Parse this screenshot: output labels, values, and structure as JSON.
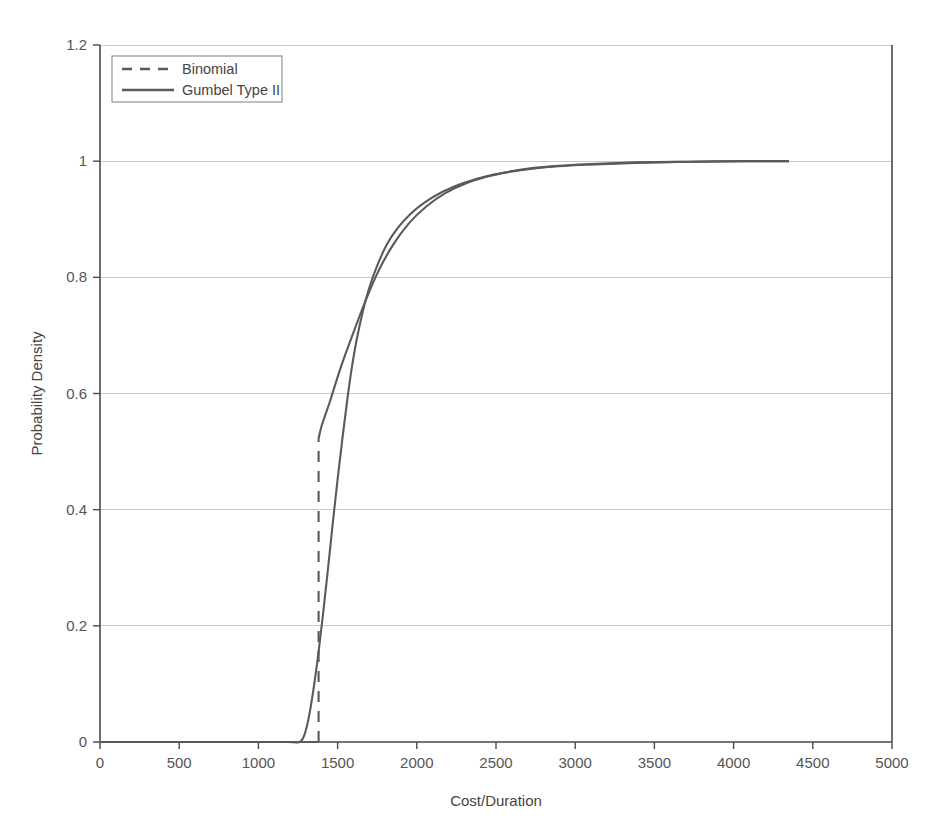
{
  "chart_data": {
    "type": "line",
    "title": "",
    "xlabel": "Cost/Duration",
    "ylabel": "Probability Density",
    "xlim": [
      0,
      5000
    ],
    "ylim": [
      0,
      1.2
    ],
    "xticks": [
      0,
      500,
      1000,
      1500,
      2000,
      2500,
      3000,
      3500,
      4000,
      4500,
      5000
    ],
    "xticklabels": [
      "0",
      "500",
      "1000",
      "1500",
      "2000",
      "2500",
      "3000",
      "3500",
      "4000",
      "4500",
      "5000"
    ],
    "yticks": [
      0,
      0.2,
      0.4,
      0.6,
      0.8,
      1,
      1.2
    ],
    "yticklabels": [
      "0",
      "0.2",
      "0.4",
      "0.6",
      "0.8",
      "1",
      "1.2"
    ],
    "grid": "horizontal",
    "legend_position": "top-left",
    "line_color": "#5a5a5a",
    "grid_color": "#c9c9c9",
    "axis_color": "#4a4a4a",
    "series": [
      {
        "name": "Binomial",
        "style": "dashed",
        "x": [
          0,
          200,
          400,
          600,
          800,
          1000,
          1200,
          1280,
          1330,
          1370,
          1380,
          1380,
          1382,
          1400,
          1450,
          1520,
          1600,
          1680,
          1760,
          1850,
          1950,
          2060,
          2180,
          2320,
          2480,
          2650,
          2850,
          3100,
          3400,
          3750,
          4100,
          4350
        ],
        "y": [
          0,
          0,
          0,
          0,
          0,
          0,
          0,
          0,
          0,
          0,
          0,
          0.52,
          0.525,
          0.545,
          0.585,
          0.645,
          0.705,
          0.762,
          0.812,
          0.856,
          0.893,
          0.922,
          0.945,
          0.963,
          0.976,
          0.985,
          0.991,
          0.995,
          0.998,
          0.999,
          1.0,
          1.0
        ]
      },
      {
        "name": "Gumbel Type II",
        "style": "solid",
        "x": [
          0,
          200,
          400,
          600,
          800,
          1000,
          1180,
          1260,
          1290,
          1320,
          1350,
          1380,
          1410,
          1440,
          1470,
          1500,
          1530,
          1560,
          1590,
          1620,
          1660,
          1700,
          1750,
          1810,
          1880,
          1960,
          2050,
          2160,
          2290,
          2440,
          2620,
          2830,
          3080,
          3380,
          3720,
          4050,
          4350
        ],
        "y": [
          0,
          0,
          0,
          0,
          0,
          0,
          0,
          0,
          0.012,
          0.045,
          0.095,
          0.155,
          0.225,
          0.3,
          0.378,
          0.452,
          0.522,
          0.587,
          0.645,
          0.692,
          0.742,
          0.782,
          0.82,
          0.856,
          0.885,
          0.909,
          0.929,
          0.947,
          0.962,
          0.974,
          0.983,
          0.99,
          0.994,
          0.997,
          0.999,
          1.0,
          1.0
        ]
      }
    ]
  },
  "legend": {
    "items": [
      {
        "label": "Binomial",
        "style": "dashed"
      },
      {
        "label": "Gumbel Type II",
        "style": "solid"
      }
    ]
  },
  "caption": {
    "text": ""
  }
}
